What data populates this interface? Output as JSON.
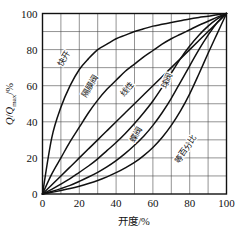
{
  "chart_data": {
    "type": "line",
    "title": "",
    "xlabel": "开度/%",
    "ylabel": "Q/Qmax/%",
    "ylabel_parts": {
      "q": "Q",
      "slash1": "/",
      "qsub": "Q",
      "sub": "max",
      "slash2": "/%"
    },
    "xlim": [
      0,
      100
    ],
    "ylim": [
      0,
      100
    ],
    "xticks": [
      "0",
      "20",
      "40",
      "60",
      "80",
      "100"
    ],
    "yticks": [
      "0",
      "20",
      "40",
      "60",
      "80",
      "100"
    ],
    "xtick_values": [
      0,
      20,
      40,
      60,
      80,
      100
    ],
    "ytick_values": [
      0,
      20,
      40,
      60,
      80,
      100
    ],
    "minor_grid_step": 10,
    "grid": true,
    "legend": "inline-curve-labels",
    "x": [
      0,
      5,
      10,
      15,
      20,
      25,
      30,
      35,
      40,
      45,
      50,
      55,
      60,
      65,
      70,
      75,
      80,
      85,
      90,
      95,
      100
    ],
    "series": [
      {
        "name": "快开",
        "label": "快开",
        "label_x": 13,
        "label_y": 74,
        "label_rotation": -58,
        "values": [
          0,
          31,
          48,
          60,
          69,
          75,
          80,
          83,
          86,
          88,
          90,
          91.5,
          93,
          94,
          95,
          96,
          97,
          97.8,
          98.5,
          99.3,
          100
        ]
      },
      {
        "name": "隔膜阀",
        "label": "隔膜阀",
        "label_x": 27,
        "label_y": 59,
        "label_rotation": -58,
        "values": [
          0,
          11,
          20,
          29,
          37,
          45,
          52,
          58,
          63,
          68,
          72,
          76,
          79.5,
          83,
          86,
          88.5,
          91,
          93.5,
          95.7,
          98,
          100
        ]
      },
      {
        "name": "线性",
        "label": "线性",
        "label_x": 47,
        "label_y": 57,
        "label_rotation": -49,
        "values": [
          0,
          5,
          10,
          15,
          20,
          25,
          30,
          35,
          40,
          45,
          50,
          55,
          60,
          65,
          70,
          75,
          80,
          85,
          90,
          95,
          100
        ]
      },
      {
        "name": "球阀",
        "label": "球阀",
        "label_x": 69,
        "label_y": 62,
        "label_rotation": -65,
        "values": [
          0,
          2.6,
          5.5,
          8.5,
          12,
          15.5,
          19.5,
          24,
          28.5,
          33.5,
          39,
          45,
          51.5,
          59,
          67,
          75,
          82,
          88,
          93,
          97,
          100
        ]
      },
      {
        "name": "蝶阀",
        "label": "蝶阀",
        "label_x": 52,
        "label_y": 32,
        "label_rotation": -58,
        "values": [
          0,
          1.4,
          3,
          4.8,
          7,
          9.4,
          12,
          15,
          18.5,
          22.5,
          27,
          32,
          38,
          45,
          53,
          62,
          71,
          80,
          88,
          95,
          100
        ]
      },
      {
        "name": "等百分比",
        "label": "等百分比",
        "label_x": 79,
        "label_y": 24,
        "label_rotation": -55,
        "values": [
          0,
          0.9,
          1.9,
          3,
          4.3,
          5.8,
          7.5,
          9.5,
          11.8,
          14.5,
          17.5,
          21.3,
          25.8,
          31.3,
          38,
          46,
          55.5,
          66.5,
          78,
          89,
          100
        ]
      }
    ],
    "colors": {
      "curve": "#111111",
      "grid": "#4a4a4a",
      "frame": "#111111",
      "text": "#111111",
      "background": "#ffffff"
    }
  }
}
